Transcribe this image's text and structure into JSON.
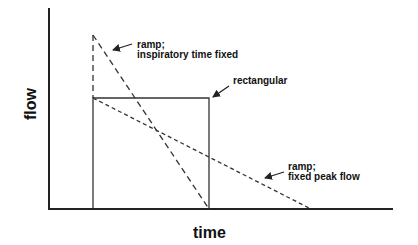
{
  "diagram": {
    "axes": {
      "x_label": "time",
      "y_label": "flow"
    },
    "curves": [
      {
        "name": "ramp-inspiratory-time-fixed",
        "label_line1": "ramp;",
        "label_line2": "inspiratory time fixed",
        "style": "long-dash"
      },
      {
        "name": "rectangular",
        "label_line1": "rectangular",
        "style": "solid"
      },
      {
        "name": "ramp-fixed-peak-flow",
        "label_line1": "ramp;",
        "label_line2": "fixed peak flow",
        "style": "short-dash"
      }
    ],
    "colors": {
      "line": "#222222",
      "background": "#ffffff"
    }
  }
}
